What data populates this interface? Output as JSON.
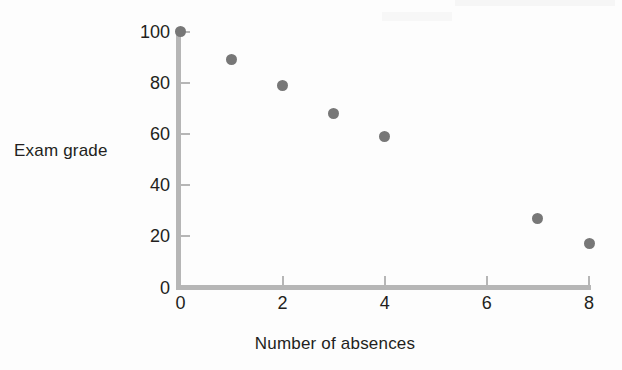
{
  "chart_data": {
    "type": "scatter",
    "title": "",
    "xlabel": "Number of absences",
    "ylabel": "Exam grade",
    "x": [
      0,
      1,
      2,
      3,
      4,
      7,
      8
    ],
    "values": [
      100,
      89,
      79,
      68,
      59,
      27,
      17
    ],
    "points": [
      {
        "x": 0,
        "y": 100
      },
      {
        "x": 1,
        "y": 89
      },
      {
        "x": 2,
        "y": 79
      },
      {
        "x": 3,
        "y": 68
      },
      {
        "x": 4,
        "y": 59
      },
      {
        "x": 7,
        "y": 27
      },
      {
        "x": 8,
        "y": 17
      }
    ],
    "xlim": [
      0,
      8
    ],
    "ylim": [
      0,
      100
    ],
    "xticks": [
      0,
      2,
      4,
      6,
      8
    ],
    "yticks": [
      0,
      20,
      40,
      60,
      80,
      100
    ],
    "xtick_labels": [
      "0",
      "2",
      "4",
      "6",
      "8"
    ],
    "ytick_labels": [
      "0",
      "20",
      "40",
      "60",
      "80",
      "100"
    ],
    "grid": false,
    "legend": false,
    "marker_color": "#777777",
    "axis_color": "#b6b6b6",
    "text_color": "#231f20",
    "background": "#fdfdfd"
  }
}
